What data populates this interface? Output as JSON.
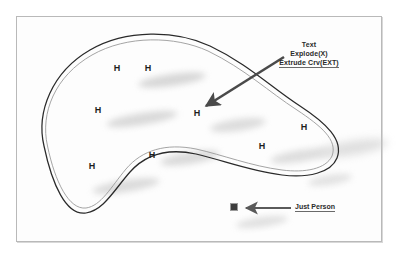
{
  "document": {
    "title": "Curve Diagram With Annotations",
    "background_color": "#ffffff",
    "frame_color": "#b9b9b9"
  },
  "colors": {
    "ink": "#1d1d1d",
    "arrow": "#4a4a4a",
    "curve_outer": "#2a2a2a",
    "curve_inner": "#8e8e8e",
    "shadow": "#c9c9c9",
    "text": "#2b2b2b",
    "person_block": "#3d3d3d"
  },
  "annotations": {
    "command_callout": {
      "name": "command-callout",
      "lines": [
        {
          "text": "Text",
          "underlined": false
        },
        {
          "text": "Explode(X)",
          "underlined": false
        },
        {
          "text": "Extrude Crv(EXT)",
          "underlined": true
        }
      ]
    },
    "person_callout": {
      "name": "person-callout",
      "lines": [
        {
          "text": "Just Person",
          "underlined": true
        }
      ]
    }
  },
  "markers": {
    "label": "H",
    "points": [
      {
        "x": 117,
        "y": 68
      },
      {
        "x": 148,
        "y": 68
      },
      {
        "x": 98,
        "y": 110
      },
      {
        "x": 197,
        "y": 113
      },
      {
        "x": 304,
        "y": 127
      },
      {
        "x": 262,
        "y": 146
      },
      {
        "x": 152,
        "y": 155
      },
      {
        "x": 92,
        "y": 166
      }
    ]
  },
  "shapes": {
    "blob_outline": {
      "name": "freeform-closed-curve",
      "description": "Closed kidney/boomerang shaped freeform curve drawn as an offset double line"
    },
    "person_block": {
      "name": "person-block",
      "x": 230,
      "y": 203,
      "width": 8,
      "height": 8
    }
  },
  "arrows": [
    {
      "name": "command-arrow",
      "from_x": 285,
      "from_y": 58,
      "to_x": 202,
      "to_y": 109
    },
    {
      "name": "person-arrow",
      "from_x": 290,
      "from_y": 208,
      "to_x": 244,
      "to_y": 208
    }
  ]
}
